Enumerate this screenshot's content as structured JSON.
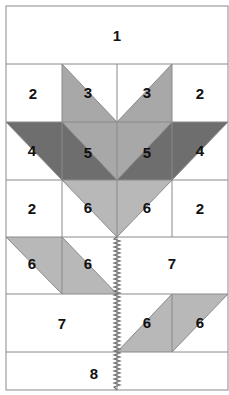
{
  "diagram": {
    "colors": {
      "background": "#ffffff",
      "light": "#b8b8b8",
      "medium": "#9c9c9c",
      "dark": "#6e6e6e",
      "grid": "#8a8a8a",
      "stem": "#707070"
    },
    "labels": {
      "r0": "1",
      "r1c0": "2",
      "r1c1": "3",
      "r1c2": "3",
      "r1c3": "2",
      "r2c0": "4",
      "r2c1": "5",
      "r2c2": "5",
      "r2c3": "4",
      "r3c0": "2",
      "r3c1": "6",
      "r3c2": "6",
      "r3c3": "2",
      "r4c0": "6",
      "r4c1": "6",
      "r4right": "7",
      "r5left": "7",
      "r5c2": "6",
      "r5c3": "6",
      "r6": "8"
    }
  }
}
